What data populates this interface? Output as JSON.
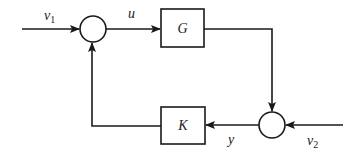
{
  "diagram": {
    "type": "feedback-block-diagram",
    "blocks": [
      {
        "id": "G",
        "label": "G"
      },
      {
        "id": "K",
        "label": "K"
      }
    ],
    "junctions": [
      {
        "id": "sum1"
      },
      {
        "id": "sum2"
      }
    ],
    "signals": {
      "v1": {
        "base": "v",
        "sub": "1"
      },
      "u": {
        "base": "u"
      },
      "y": {
        "base": "y"
      },
      "v2": {
        "base": "v",
        "sub": "2"
      }
    },
    "colors": {
      "stroke": "#1a1a1a",
      "background": "#ffffff"
    }
  }
}
